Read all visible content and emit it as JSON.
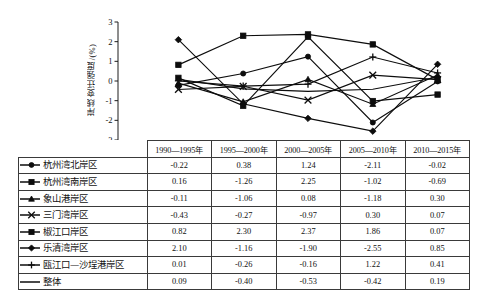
{
  "chart": {
    "ylabel": "岸线变迁强度/(%)",
    "y_ticks": [
      "3",
      "2",
      "1",
      "0",
      "-1",
      "-2",
      "-3"
    ]
  },
  "table": {
    "corner_label": "",
    "columns": [
      "1990—1995年",
      "1995—2000年",
      "2000—2005年",
      "2005—2010年",
      "2010—2015年"
    ],
    "rows": [
      {
        "label": "杭州湾北岸区",
        "marker": "circle-marker",
        "values": [
          "-0.22",
          "0.38",
          "1.24",
          "-2.11",
          "-0.02"
        ]
      },
      {
        "label": "杭州湾南岸区",
        "marker": "filled-square-marker",
        "values": [
          "0.16",
          "-1.26",
          "2.25",
          "-1.02",
          "-0.69"
        ]
      },
      {
        "label": "象山港岸区",
        "marker": "triangle-marker",
        "values": [
          "-0.11",
          "-1.06",
          "0.08",
          "-1.18",
          "0.30"
        ]
      },
      {
        "label": "三门湾岸区",
        "marker": "cross-marker",
        "values": [
          "-0.43",
          "-0.27",
          "-0.97",
          "0.30",
          "0.07"
        ]
      },
      {
        "label": "椒江口岸区",
        "marker": "square-marker",
        "values": [
          "0.82",
          "2.30",
          "2.37",
          "1.86",
          "0.07"
        ]
      },
      {
        "label": "乐清湾岸区",
        "marker": "diamond-marker",
        "values": [
          "2.10",
          "-1.16",
          "-1.90",
          "-2.55",
          "0.85"
        ]
      },
      {
        "label": "瓯江口—沙埕港岸区",
        "marker": "plus-marker",
        "values": [
          "0.01",
          "-0.26",
          "-0.16",
          "1.22",
          "0.41"
        ]
      },
      {
        "label": "整体",
        "marker": "plain-line",
        "values": [
          "0.09",
          "-0.40",
          "-0.53",
          "-0.42",
          "0.19"
        ]
      }
    ]
  },
  "chart_data": {
    "type": "line",
    "title": "",
    "xlabel": "",
    "ylabel": "岸线变迁强度/(%)",
    "ylim": [
      -3,
      3
    ],
    "grid": false,
    "legend_position": "table-below",
    "categories": [
      "1990—1995年",
      "1995—2000年",
      "2000—2005年",
      "2005—2010年",
      "2010—2015年"
    ],
    "series": [
      {
        "name": "杭州湾北岸区",
        "marker": "circle",
        "values": [
          -0.22,
          0.38,
          1.24,
          -2.11,
          -0.02
        ]
      },
      {
        "name": "杭州湾南岸区",
        "marker": "filled-square",
        "values": [
          0.16,
          -1.26,
          2.25,
          -1.02,
          -0.69
        ]
      },
      {
        "name": "象山港岸区",
        "marker": "triangle",
        "values": [
          -0.11,
          -1.06,
          0.08,
          -1.18,
          0.3
        ]
      },
      {
        "name": "三门湾岸区",
        "marker": "cross",
        "values": [
          -0.43,
          -0.27,
          -0.97,
          0.3,
          0.07
        ]
      },
      {
        "name": "椒江口岸区",
        "marker": "square",
        "values": [
          0.82,
          2.3,
          2.37,
          1.86,
          0.07
        ]
      },
      {
        "name": "乐清湾岸区",
        "marker": "diamond",
        "values": [
          2.1,
          -1.16,
          -1.9,
          -2.55,
          0.85
        ]
      },
      {
        "name": "瓯江口—沙埕港岸区",
        "marker": "plus",
        "values": [
          0.01,
          -0.26,
          -0.16,
          1.22,
          0.41
        ]
      },
      {
        "name": "整体",
        "marker": "none",
        "values": [
          0.09,
          -0.4,
          -0.53,
          -0.42,
          0.19
        ]
      }
    ]
  }
}
